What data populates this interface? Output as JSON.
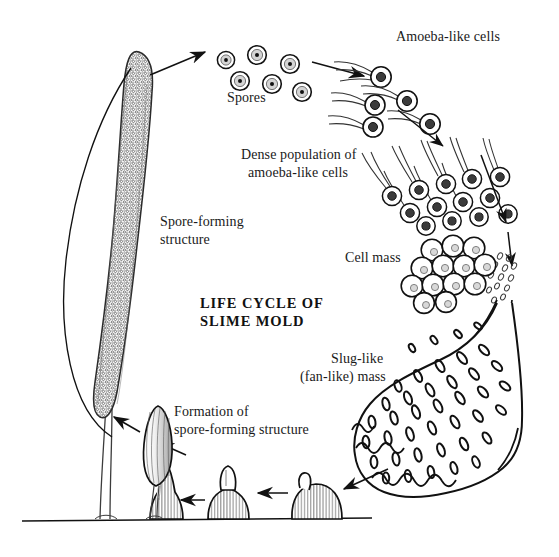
{
  "figure": {
    "title_line1": "LIFE CYCLE OF",
    "title_line2": "SLIME MOLD",
    "ink_color": "#111111",
    "background_color": "#ffffff"
  },
  "labels": {
    "spores": "Spores",
    "amoeba_like_cells": "Amoeba-like cells",
    "dense_population_l1": "Dense population of",
    "dense_population_l2": "amoeba-like cells",
    "cell_mass": "Cell mass",
    "slug_like_l1": "Slug-like",
    "slug_like_l2": "(fan-like) mass",
    "spore_forming_l1": "Spore-forming",
    "spore_forming_l2": "structure",
    "formation_l1": "Formation of",
    "formation_l2": "spore-forming structure"
  },
  "stages": [
    {
      "name": "spore-forming-structure",
      "label": "Spore-forming structure"
    },
    {
      "name": "spores",
      "label": "Spores",
      "count": 6
    },
    {
      "name": "amoeba-like-cells",
      "label": "Amoeba-like cells",
      "count": 6
    },
    {
      "name": "dense-population",
      "label": "Dense population of amoeba-like cells",
      "count": 13
    },
    {
      "name": "cell-mass",
      "label": "Cell mass",
      "count": 13
    },
    {
      "name": "slug-like-mass",
      "label": "Slug-like (fan-like) mass"
    },
    {
      "name": "mound-stage-1",
      "label": "Mound"
    },
    {
      "name": "mound-stage-2",
      "label": "Rising mound"
    },
    {
      "name": "mound-stage-3",
      "label": "Pointed cone"
    },
    {
      "name": "mound-stage-4",
      "label": "Elongating fruiting body"
    },
    {
      "name": "mature-fruiting-body",
      "label": "Mature spore-forming structure"
    }
  ]
}
